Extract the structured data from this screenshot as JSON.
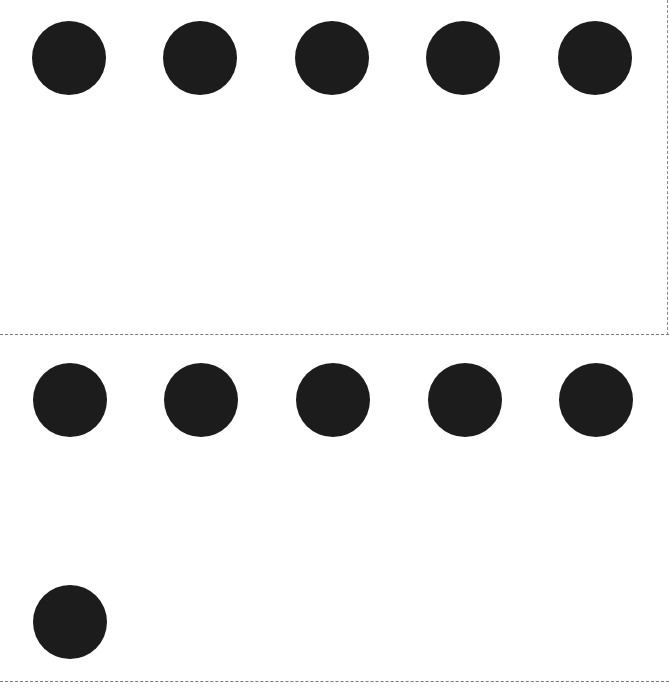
{
  "page": {
    "background": "#ffffff",
    "divider_color": "#7a7a7a"
  },
  "sections": [
    {
      "name": "top-section",
      "dot_count": 5,
      "dots": [
        {
          "cx": 69,
          "cy": 58
        },
        {
          "cx": 200,
          "cy": 58
        },
        {
          "cx": 332,
          "cy": 58
        },
        {
          "cx": 463,
          "cy": 58
        },
        {
          "cx": 595,
          "cy": 58
        }
      ]
    },
    {
      "name": "bottom-section",
      "dot_count": 6,
      "dots": [
        {
          "cx": 70,
          "cy": 400
        },
        {
          "cx": 201,
          "cy": 400
        },
        {
          "cx": 333,
          "cy": 400
        },
        {
          "cx": 465,
          "cy": 400
        },
        {
          "cx": 596,
          "cy": 400
        },
        {
          "cx": 70,
          "cy": 623
        }
      ]
    }
  ],
  "dot_style": {
    "color": "#1c1c1c",
    "diameter": 74
  },
  "total_dots": 11
}
